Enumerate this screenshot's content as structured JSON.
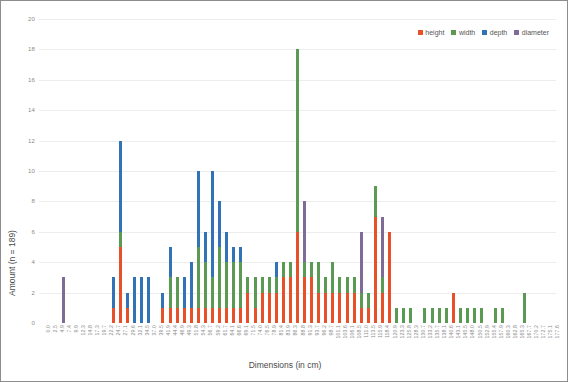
{
  "chart_data": {
    "type": "bar",
    "stacked": true,
    "title": "",
    "xlabel": "Dimensions (in cm)",
    "ylabel": "Amount (n = 189)",
    "ylim": [
      0,
      20
    ],
    "ytick_step": 2,
    "yticks": [
      "0",
      "2",
      "4",
      "6",
      "8",
      "10",
      "12",
      "14",
      "16",
      "18",
      "20"
    ],
    "grid": true,
    "legend_position": "top-right",
    "colors": {
      "height": "#e8502a",
      "width": "#5a9a52",
      "depth": "#3273b8",
      "diameter": "#7f6b97"
    },
    "legend": [
      {
        "name": "height",
        "color": "#e8502a"
      },
      {
        "name": "width",
        "color": "#5a9a52"
      },
      {
        "name": "depth",
        "color": "#3273b8"
      },
      {
        "name": "diameter",
        "color": "#7f6b97"
      }
    ],
    "categories": [
      "0.0",
      "2.5",
      "4.9",
      "7.4",
      "9.9",
      "12.3",
      "14.8",
      "17.3",
      "19.7",
      "22.2",
      "24.7",
      "27.1",
      "29.6",
      "32.1",
      "34.5",
      "37.0",
      "39.5",
      "41.9",
      "44.4",
      "46.9",
      "49.3",
      "51.8",
      "54.3",
      "56.7",
      "59.2",
      "61.7",
      "64.1",
      "66.6",
      "69.1",
      "71.5",
      "74.0",
      "76.5",
      "78.9",
      "81.4",
      "83.9",
      "86.3",
      "88.8",
      "91.3",
      "93.7",
      "96.2",
      "98.7",
      "101.1",
      "103.6",
      "106.1",
      "108.5",
      "111.0",
      "113.5",
      "115.9",
      "118.4",
      "120.9",
      "123.3",
      "125.8",
      "128.3",
      "130.7",
      "133.2",
      "135.7",
      "138.1",
      "140.6",
      "143.1",
      "145.5",
      "148.0",
      "150.5",
      "152.9",
      "155.4",
      "157.9",
      "160.3",
      "162.8",
      "165.3",
      "167.7",
      "170.2",
      "172.7",
      "175.1",
      "177.6"
    ],
    "series": [
      {
        "name": "height",
        "color": "#e8502a",
        "values": [
          0,
          0,
          0,
          0,
          0,
          0,
          0,
          0,
          0,
          0,
          1,
          5,
          1,
          0,
          0,
          0,
          0,
          1,
          1,
          1,
          1,
          1,
          1,
          1,
          1,
          1,
          1,
          1,
          1,
          2,
          1,
          2,
          2,
          2,
          3,
          3,
          6,
          3,
          3,
          2,
          2,
          2,
          2,
          2,
          2,
          1,
          1,
          7,
          2,
          6,
          0,
          0,
          0,
          0,
          0,
          0,
          0,
          0,
          2,
          0,
          0,
          0,
          0,
          0,
          0,
          0,
          0,
          0,
          0,
          0,
          0,
          0,
          0
        ]
      },
      {
        "name": "width",
        "color": "#5a9a52",
        "values": [
          0,
          0,
          0,
          0,
          0,
          0,
          0,
          0,
          0,
          0,
          0,
          1,
          0,
          0,
          0,
          0,
          0,
          0,
          2,
          2,
          0,
          0,
          4,
          3,
          2,
          4,
          3,
          3,
          3,
          1,
          2,
          1,
          1,
          1,
          1,
          1,
          12,
          1,
          1,
          2,
          1,
          2,
          1,
          1,
          1,
          1,
          1,
          2,
          1,
          0,
          1,
          1,
          1,
          0,
          1,
          1,
          1,
          1,
          0,
          1,
          1,
          1,
          1,
          0,
          1,
          1,
          0,
          0,
          2,
          0,
          0,
          0,
          0
        ]
      },
      {
        "name": "depth",
        "color": "#3273b8",
        "values": [
          0,
          0,
          0,
          0,
          0,
          0,
          0,
          0,
          0,
          0,
          2,
          6,
          1,
          3,
          3,
          3,
          0,
          1,
          2,
          0,
          2,
          3,
          5,
          2,
          7,
          3,
          2,
          1,
          1,
          0,
          0,
          0,
          0,
          1,
          0,
          0,
          0,
          0,
          0,
          0,
          0,
          0,
          0,
          0,
          0,
          0,
          0,
          0,
          0,
          0,
          0,
          0,
          0,
          0,
          0,
          0,
          0,
          0,
          0,
          0,
          0,
          0,
          0,
          0,
          0,
          0,
          0,
          0,
          0,
          0,
          0,
          0,
          0
        ]
      },
      {
        "name": "diameter",
        "color": "#7f6b97",
        "values": [
          0,
          0,
          0,
          3,
          0,
          0,
          0,
          0,
          0,
          0,
          0,
          0,
          0,
          0,
          0,
          0,
          0,
          0,
          0,
          0,
          0,
          0,
          0,
          0,
          0,
          0,
          0,
          0,
          0,
          0,
          0,
          0,
          0,
          0,
          0,
          0,
          0,
          4,
          0,
          0,
          0,
          0,
          0,
          0,
          0,
          4,
          0,
          0,
          4,
          0,
          0,
          0,
          0,
          0,
          0,
          0,
          0,
          0,
          0,
          0,
          0,
          0,
          0,
          0,
          0,
          0,
          0,
          0,
          0,
          0,
          0,
          0,
          0
        ]
      }
    ]
  }
}
